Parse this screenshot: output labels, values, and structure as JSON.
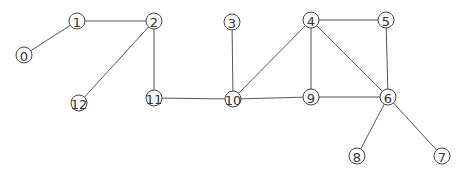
{
  "graph": {
    "node_radius": 8,
    "nodes": [
      {
        "id": "0",
        "label": "0",
        "x": 24,
        "y": 55
      },
      {
        "id": "1",
        "label": "1",
        "x": 77,
        "y": 21
      },
      {
        "id": "2",
        "label": "2",
        "x": 154,
        "y": 21
      },
      {
        "id": "3",
        "label": "3",
        "x": 232,
        "y": 22
      },
      {
        "id": "4",
        "label": "4",
        "x": 311,
        "y": 20
      },
      {
        "id": "5",
        "label": "5",
        "x": 386,
        "y": 20
      },
      {
        "id": "6",
        "label": "6",
        "x": 388,
        "y": 97
      },
      {
        "id": "7",
        "label": "7",
        "x": 442,
        "y": 156
      },
      {
        "id": "8",
        "label": "8",
        "x": 357,
        "y": 156
      },
      {
        "id": "9",
        "label": "9",
        "x": 311,
        "y": 97
      },
      {
        "id": "10",
        "label": "10",
        "x": 233,
        "y": 99
      },
      {
        "id": "11",
        "label": "11",
        "x": 154,
        "y": 98
      },
      {
        "id": "12",
        "label": "12",
        "x": 79,
        "y": 103
      }
    ],
    "edges": [
      [
        "0",
        "1"
      ],
      [
        "1",
        "2"
      ],
      [
        "2",
        "12"
      ],
      [
        "2",
        "11"
      ],
      [
        "11",
        "10"
      ],
      [
        "3",
        "10"
      ],
      [
        "10",
        "4"
      ],
      [
        "10",
        "9"
      ],
      [
        "4",
        "5"
      ],
      [
        "4",
        "9"
      ],
      [
        "4",
        "6"
      ],
      [
        "5",
        "6"
      ],
      [
        "9",
        "6"
      ],
      [
        "6",
        "8"
      ],
      [
        "6",
        "7"
      ]
    ]
  }
}
